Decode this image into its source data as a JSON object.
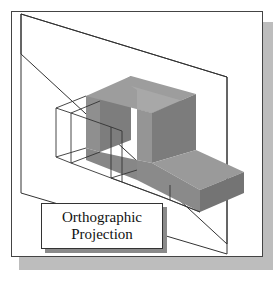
{
  "figure": {
    "caption_line1": "Orthographic",
    "caption_line2": "Projection",
    "colors": {
      "frame_border": "#444444",
      "frame_shadow": "#bdbdbd",
      "solid_top": "#9a9a9a",
      "solid_front": "#8c8c8c",
      "solid_side": "#7a7a7a",
      "wireframe": "#333333"
    }
  }
}
